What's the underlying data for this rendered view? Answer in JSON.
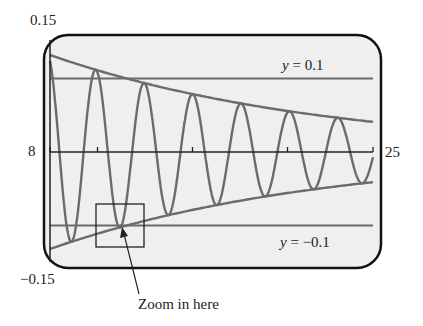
{
  "chart_data": {
    "type": "line",
    "title": "",
    "xlabel": "",
    "ylabel": "",
    "xlim": [
      8,
      25
    ],
    "ylim": [
      -0.15,
      0.15
    ],
    "x_tick_labels": {
      "left": "8",
      "right": "25"
    },
    "y_tick_labels": {
      "top": "0.15",
      "bottom": "-0.15"
    },
    "x_ticks": [
      8,
      10.5,
      15.5,
      20.5,
      25
    ],
    "grid": false,
    "series": [
      {
        "name": "damped oscillation",
        "kind": "function",
        "envelope_start": 0.132,
        "envelope_end": 0.041,
        "period": 2.55,
        "phase_x": 8.0,
        "color": "#6b6b6b"
      },
      {
        "name": "upper envelope",
        "kind": "function",
        "start": 0.132,
        "end": 0.041,
        "color": "#6b6b6b"
      },
      {
        "name": "lower envelope",
        "kind": "function",
        "start": -0.132,
        "end": -0.041,
        "color": "#6b6b6b"
      },
      {
        "name": "y = 0.1",
        "kind": "hline",
        "y": 0.1,
        "color": "#6b6b6b"
      },
      {
        "name": "y = -0.1",
        "kind": "hline",
        "y": -0.1,
        "color": "#6b6b6b"
      }
    ],
    "annotations": [
      {
        "text": "y = 0.1",
        "near": "upper horizontal line, right"
      },
      {
        "text": "y = -0.1",
        "near": "lower horizontal line, right"
      },
      {
        "text": "Zoom in here",
        "target_box": {
          "x": [
            10.5,
            13.0
          ],
          "y": [
            -0.142,
            -0.07
          ]
        }
      }
    ]
  },
  "labels": {
    "y_top": "0.15",
    "y_bottom": "−0.15",
    "x_left": "8",
    "x_right": "25",
    "hline_top_var": "y",
    "hline_top_eq": " = 0.1",
    "hline_bottom_var": "y",
    "hline_bottom_eq": " = −0.1",
    "callout": "Zoom in here"
  },
  "colors": {
    "frame": "#111111",
    "screen_bg": "#efefef",
    "curve": "#6b6b6b",
    "axis": "#222222"
  }
}
